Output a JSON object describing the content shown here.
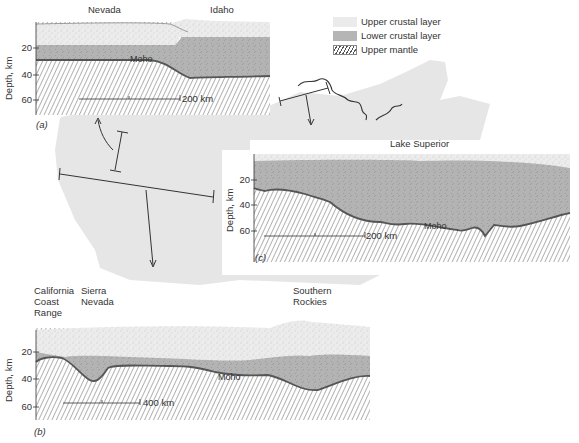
{
  "figure": {
    "legend": {
      "items": [
        {
          "key": "upper",
          "label": "Upper crustal layer"
        },
        {
          "key": "lower",
          "label": "Lower crustal layer"
        },
        {
          "key": "mantle",
          "label": "Upper mantle"
        }
      ]
    },
    "colors": {
      "upper_crust": "#ebebeb",
      "lower_crust": "#b5b5b5",
      "mantle_hatch": "#555555",
      "moho_line": "#555555",
      "map_background": "#e6e6e6"
    },
    "panels": {
      "a": {
        "caption": "(a)",
        "region_labels": [
          "Nevada",
          "Idaho"
        ],
        "y_axis_label": "Depth, km",
        "y_ticks": [
          "20",
          "40",
          "60"
        ],
        "moho_label": "Moho",
        "scale_bar": "200 km"
      },
      "b": {
        "caption": "(b)",
        "region_labels": [
          "California\nCoast\nRange",
          "Sierra\nNevada",
          "Southern\nRockies"
        ],
        "region_lines": {
          "california": [
            "California",
            "Coast",
            "Range"
          ],
          "sierra": [
            "Sierra",
            "Nevada"
          ],
          "rockies": [
            "Southern",
            "Rockies"
          ]
        },
        "y_axis_label": "Depth, km",
        "y_ticks": [
          "20",
          "40",
          "60"
        ],
        "moho_label": "Moho",
        "scale_bar": "400 km"
      },
      "c": {
        "caption": "(c)",
        "title": "Lake Superior",
        "y_axis_label": "Depth, km",
        "y_ticks": [
          "20",
          "40",
          "60"
        ],
        "moho_label": "Moho",
        "scale_bar": "200 km"
      }
    }
  }
}
